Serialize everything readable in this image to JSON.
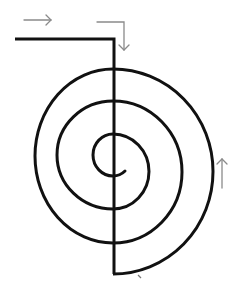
{
  "diagram": {
    "type": "spiral-path-diagram",
    "colors": {
      "background": "#ffffff",
      "path": "#111111",
      "arrow": "#8a8a8a"
    },
    "elements": {
      "entry_line": "horizontal entry line turning down into spiral",
      "spiral": "semicircular spiral with vertical axis line",
      "arrows": [
        {
          "name": "arrow-right",
          "direction": "right"
        },
        {
          "name": "arrow-right-then-down",
          "direction": "right-then-down"
        },
        {
          "name": "arrow-up",
          "direction": "up"
        }
      ]
    }
  }
}
